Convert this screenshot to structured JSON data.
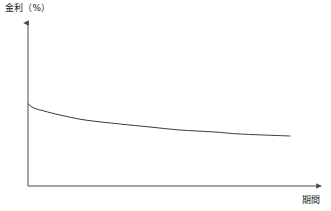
{
  "chart_data": {
    "type": "line",
    "title": "",
    "subtitle": "",
    "ylabel": "金利（%）",
    "xlabel": "期間",
    "legend": [],
    "grid": false,
    "axis_style": "arrow-axes",
    "annotations": [],
    "series": [
      {
        "name": "金利曲線",
        "color": "#3a3a3a",
        "x": [
          0,
          2,
          5,
          10,
          18,
          28,
          40,
          55,
          70,
          85,
          100
        ],
        "y": [
          100,
          87,
          78,
          70,
          62,
          55,
          49,
          43,
          38,
          34,
          31
        ],
        "points_px": [
          [
            28,
            104
          ],
          [
            34,
            108
          ],
          [
            44,
            111
          ],
          [
            60,
            115
          ],
          [
            85,
            120
          ],
          [
            120,
            124
          ],
          [
            150,
            127
          ],
          [
            180,
            130
          ],
          [
            215,
            132
          ],
          [
            240,
            134
          ],
          [
            290,
            136
          ]
        ]
      }
    ],
    "xlim": [
      0,
      100
    ],
    "ylim": [
      0,
      120
    ],
    "xticks": [],
    "yticks": [],
    "description_shape": "downward-sloping decaying curve"
  },
  "axes": {
    "y_axis_name": "y-axis",
    "x_axis_name": "x-axis",
    "origin_px": [
      28,
      186
    ],
    "y_top_px": [
      28,
      20
    ],
    "x_right_px": [
      324,
      186
    ],
    "line_color": "#4a4a4a"
  },
  "colors": {
    "background": "#ffffff",
    "axis": "#4a4a4a",
    "curve": "#3a3a3a",
    "text": "#1a1a1a"
  }
}
